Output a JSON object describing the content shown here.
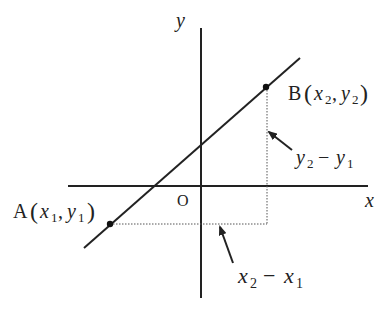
{
  "diagram": {
    "type": "coordinate-geometry",
    "axes": {
      "x_label": "x",
      "y_label": "y",
      "origin_label": "O"
    },
    "points": {
      "A": {
        "name": "A",
        "coords": "(x1, y1)",
        "x_sub": "x",
        "x_idx": "1",
        "y_sub": "y",
        "y_idx": "1"
      },
      "B": {
        "name": "B",
        "coords": "(x2, y2)",
        "x_sub": "x",
        "x_idx": "2",
        "y_sub": "y",
        "y_idx": "2"
      }
    },
    "annotations": {
      "rise": {
        "text": "y2 − y1",
        "a": "y",
        "a_idx": "2",
        "op": "−",
        "b": "y",
        "b_idx": "1"
      },
      "run": {
        "text": "x2 − x1",
        "a": "x",
        "a_idx": "2",
        "op": "−",
        "b": "x",
        "b_idx": "1"
      }
    },
    "colors": {
      "stroke": "#222222",
      "dotted": "#555555",
      "background": "#ffffff"
    }
  }
}
